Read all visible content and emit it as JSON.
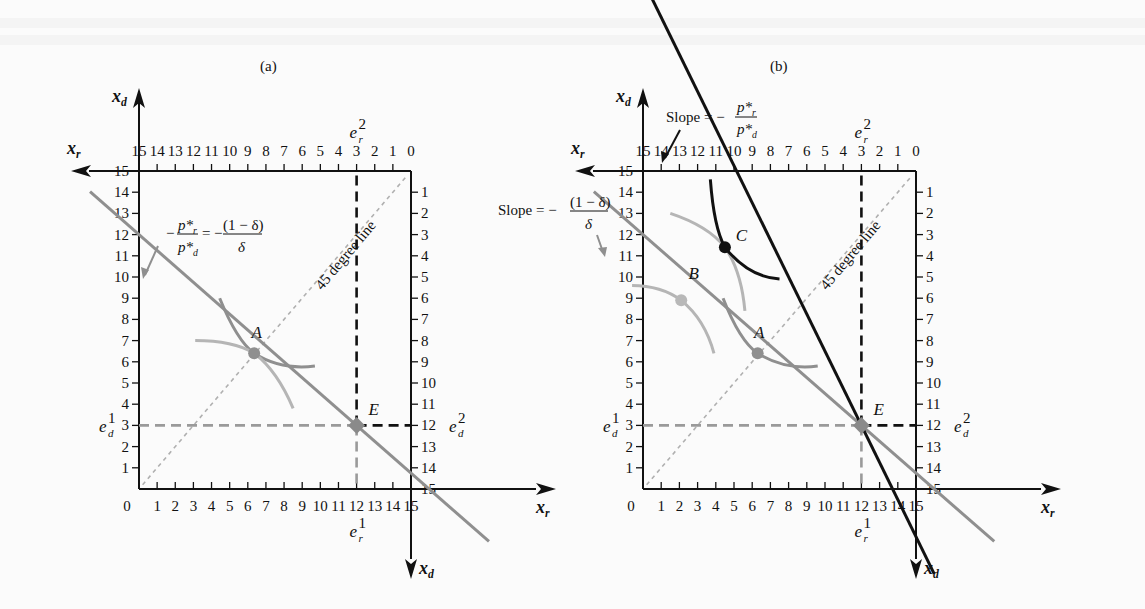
{
  "figure": {
    "panels": [
      {
        "id": "a",
        "label": "(a)",
        "axis_labels": {
          "xr": "x",
          "xr_sub": "r",
          "xd": "x",
          "xd_sub": "d"
        },
        "bottom_ticks": [
          "0",
          "1",
          "2",
          "3",
          "4",
          "5",
          "6",
          "7",
          "8",
          "9",
          "10",
          "11",
          "12",
          "13",
          "14",
          "15"
        ],
        "top_ticks": [
          "15",
          "14",
          "13",
          "12",
          "11",
          "10",
          "9",
          "8",
          "7",
          "6",
          "5",
          "4",
          "3",
          "2",
          "1",
          "0"
        ],
        "left_ticks": [
          "1",
          "2",
          "3",
          "4",
          "5",
          "6",
          "7",
          "8",
          "9",
          "10",
          "11",
          "12",
          "13",
          "14",
          "15"
        ],
        "right_ticks": [
          "1",
          "2",
          "3",
          "4",
          "5",
          "6",
          "7",
          "8",
          "9",
          "10",
          "11",
          "12",
          "13",
          "14",
          "15"
        ],
        "endowment": {
          "er1": "e",
          "er1_sup": "1",
          "er2": "e",
          "er2_sup": "2",
          "ed1": "e",
          "ed1_sup": "1",
          "ed2": "e",
          "ed2_sup": "2",
          "sub_r": "r",
          "sub_d": "d"
        },
        "points": {
          "A": "A",
          "E": "E"
        },
        "diagonal_label": "45 degree line",
        "slope_annotation": {
          "lhs_num": "p*",
          "lhs_num_sub": "r",
          "lhs_den": "p*",
          "lhs_den_sub": "d",
          "rhs_num": "(1 − δ)",
          "rhs_den": "δ",
          "minus": "−",
          "equals": "="
        }
      },
      {
        "id": "b",
        "label": "(b)",
        "axis_labels": {
          "xr": "x",
          "xr_sub": "r",
          "xd": "x",
          "xd_sub": "d"
        },
        "bottom_ticks": [
          "0",
          "1",
          "2",
          "3",
          "4",
          "5",
          "6",
          "7",
          "8",
          "9",
          "10",
          "11",
          "12",
          "13",
          "14",
          "15"
        ],
        "top_ticks": [
          "15",
          "14",
          "13",
          "12",
          "11",
          "10",
          "9",
          "8",
          "7",
          "6",
          "5",
          "4",
          "3",
          "2",
          "1",
          "0"
        ],
        "left_ticks": [
          "1",
          "2",
          "3",
          "4",
          "5",
          "6",
          "7",
          "8",
          "9",
          "10",
          "11",
          "12",
          "13",
          "14",
          "15"
        ],
        "right_ticks": [
          "1",
          "2",
          "3",
          "4",
          "5",
          "6",
          "7",
          "8",
          "9",
          "10",
          "11",
          "12",
          "13",
          "14",
          "15"
        ],
        "points": {
          "A": "A",
          "B": "B",
          "C": "C",
          "E": "E"
        },
        "diagonal_label": "45 degree line",
        "slope_market": {
          "prefix": "Slope = −",
          "num": "p*",
          "num_sub": "r",
          "den": "p*",
          "den_sub": "d"
        },
        "slope_autarky": {
          "prefix": "Slope = −",
          "num": "(1 − δ)",
          "den": "δ"
        }
      }
    ],
    "colors": {
      "axis": "#111111",
      "gray_line": "#8f8f8f",
      "light_gray": "#b5b5b5",
      "black_line": "#111111",
      "dashed_gray": "#9a9a9a"
    }
  }
}
